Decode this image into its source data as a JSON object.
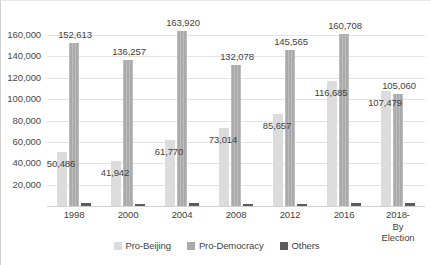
{
  "chart_data": {
    "type": "bar",
    "title": "",
    "subtitle": "",
    "xlabel": "",
    "ylabel": "",
    "grid": true,
    "legend_position": "bottom",
    "categories": [
      "1998",
      "2000",
      "2004",
      "2008",
      "2012",
      "2016",
      "2018-By\nElection"
    ],
    "ytick_labels": [
      "20,000",
      "40,000",
      "60,000",
      "80,000",
      "100,000",
      "120,000",
      "140,000",
      "160,000"
    ],
    "ytick_values": [
      20000,
      40000,
      60000,
      80000,
      100000,
      120000,
      140000,
      160000
    ],
    "ylim": [
      0,
      175000
    ],
    "series": [
      {
        "name": "Pro-Beijing",
        "color": "#dcdcdc",
        "values": [
          50486,
          41942,
          61770,
          73014,
          85657,
          116685,
          107479
        ],
        "labels": [
          "50,486",
          "41,942",
          "61,770",
          "73,014",
          "85,657",
          "116,685",
          "107,479"
        ]
      },
      {
        "name": "Pro-Democracy",
        "color": "#aaaaaa",
        "values": [
          152613,
          136257,
          163920,
          132078,
          145565,
          160708,
          105060
        ],
        "labels": [
          "152,613",
          "136,257",
          "163,920",
          "132,078",
          "145,565",
          "160,708",
          "105,060"
        ]
      },
      {
        "name": "Others",
        "color": "#5c5c5c",
        "values": [
          2600,
          1500,
          2700,
          1700,
          1900,
          2400,
          3200
        ],
        "labels": [
          "",
          "",
          "",
          "",
          "",
          "",
          ""
        ]
      }
    ]
  }
}
